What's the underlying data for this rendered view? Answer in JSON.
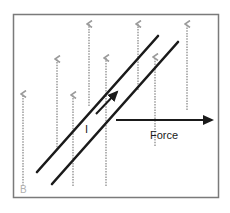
{
  "diagram": {
    "labels": {
      "current": "I",
      "force": "Force",
      "field": "B"
    },
    "colors": {
      "frame": "#7a7a7a",
      "field_lines": "#9a9a9a",
      "wire": "#1a1a1a",
      "force_arrow": "#1a1a1a",
      "field_label": "#b0b0b0"
    },
    "field_lines": [
      {
        "x": 23,
        "y_top": 92,
        "y_bottom": 186
      },
      {
        "x": 57,
        "y_top": 57,
        "y_bottom": 150
      },
      {
        "x": 73,
        "y_top": 93,
        "y_bottom": 186
      },
      {
        "x": 89,
        "y_top": 22,
        "y_bottom": 106
      },
      {
        "x": 106,
        "y_top": 56,
        "y_bottom": 186
      },
      {
        "x": 138,
        "y_top": 22,
        "y_bottom": 90
      },
      {
        "x": 155,
        "y_top": 55,
        "y_bottom": 146
      },
      {
        "x": 187,
        "y_top": 22,
        "y_bottom": 110
      }
    ],
    "wires": [
      {
        "x1": 37,
        "y1": 172,
        "x2": 158,
        "y2": 36
      },
      {
        "x1": 52,
        "y1": 184,
        "x2": 178,
        "y2": 42
      }
    ],
    "current_arrow": {
      "x1": 96,
      "y1": 114,
      "x2": 117,
      "y2": 92
    },
    "force_arrow": {
      "x1": 116,
      "y1": 120,
      "x2": 212,
      "y2": 120
    }
  }
}
